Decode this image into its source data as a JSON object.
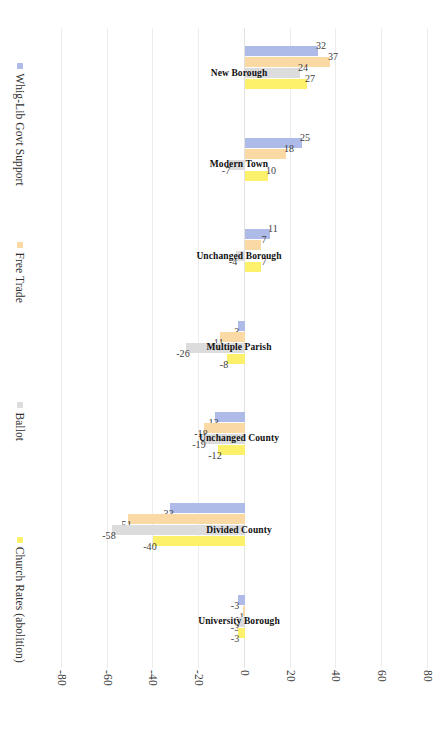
{
  "chart_data": {
    "type": "bar",
    "title": "",
    "subtitle": "",
    "xlabel": "",
    "ylabel": "",
    "ylim": [
      -80,
      80
    ],
    "yticks": [
      80,
      60,
      40,
      20,
      0,
      -20,
      -40,
      -60,
      -80
    ],
    "ytick_labels": [
      "80",
      "60",
      "40",
      "20",
      "0",
      "-20",
      "-40",
      "-60",
      "-80"
    ],
    "grid": true,
    "orientation": "vertical-bars-rotated",
    "legend_position": "right",
    "categories": [
      "New Borough",
      "Modern Town",
      "Unchanged Borough",
      "Multiple Parish",
      "Unchanged County",
      "Divided County",
      "University Borough"
    ],
    "series": [
      {
        "name": "Whig-Lib Govt Support",
        "color": "#aebae8",
        "values": [
          32,
          25,
          11,
          -3,
          -13,
          -33,
          -3
        ],
        "labels": [
          "32",
          "25",
          "11",
          "-3",
          "-13",
          "-33",
          "-3"
        ]
      },
      {
        "name": "Free Trade",
        "color": "#fbd9a5",
        "values": [
          37,
          18,
          7,
          -11,
          -18,
          -51,
          -1
        ],
        "labels": [
          "37",
          "18",
          "7",
          "-11",
          "-18",
          "-51",
          "-1"
        ]
      },
      {
        "name": "Ballot",
        "color": "#dcdcdc",
        "values": [
          24,
          -7,
          -4,
          -26,
          -19,
          -58,
          -3
        ],
        "labels": [
          "24",
          "-7",
          "-4",
          "-26",
          "-19",
          "-58",
          "-3"
        ]
      },
      {
        "name": "Church Rates (abolition)",
        "color": "#fdf06a",
        "values": [
          27,
          10,
          7,
          -8,
          -12,
          -40,
          -3
        ],
        "labels": [
          "27",
          "10",
          "7",
          "-8",
          "-12",
          "-40",
          "-3"
        ]
      }
    ]
  },
  "legend": {
    "items": [
      {
        "label": "Whig-Lib Govt Support",
        "color": "#aebae8"
      },
      {
        "label": "Free Trade",
        "color": "#fbd9a5"
      },
      {
        "label": "Ballot",
        "color": "#dcdcdc"
      },
      {
        "label": "Church Rates (abolition)",
        "color": "#fdf06a"
      }
    ]
  },
  "axis": {
    "tick_labels": [
      "80",
      "60",
      "40",
      "20",
      "0",
      "-20",
      "-40",
      "-60",
      "-80"
    ]
  }
}
